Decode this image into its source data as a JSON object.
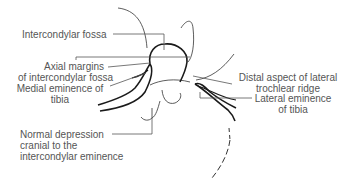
{
  "diagram": {
    "colors": {
      "background": "#ffffff",
      "outline": "#1a1a1a",
      "leader": "#555555",
      "text": "#555555"
    },
    "labels": {
      "intercondylar_fossa": "Intercondylar fossa",
      "axial_margins_line1": "Axial margins",
      "axial_margins_line2": "of intercondylar fossa",
      "medial_eminence_line1": "Medial eminence of",
      "medial_eminence_line2": "tibia",
      "normal_depression_line1": "Normal depression",
      "normal_depression_line2": "cranial to the",
      "normal_depression_line3": "intercondylar eminence",
      "distal_aspect_line1": "Distal aspect of lateral",
      "distal_aspect_line2": "trochlear ridge",
      "lateral_eminence_line1": "Lateral eminence",
      "lateral_eminence_line2": "of tibia"
    }
  }
}
